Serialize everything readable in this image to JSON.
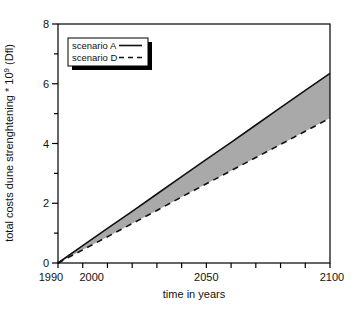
{
  "figure": {
    "background": "#ffffff",
    "axis_color": "#000000",
    "text_color": "#111111"
  },
  "chart_data": {
    "type": "line",
    "title": "",
    "xlabel": "time in years",
    "ylabel": "total costs dune strenghtening * 10⁹ (Dfl)",
    "ylabel_parts": {
      "text": "total costs dune strenghtening * 10",
      "sup": "9",
      "suffix": " (Dfl)"
    },
    "xlim": [
      1990,
      2100
    ],
    "ylim": [
      0,
      8
    ],
    "grid": false,
    "x": [
      1990,
      2000,
      2010,
      2020,
      2030,
      2040,
      2050,
      2060,
      2070,
      2080,
      2090,
      2100
    ],
    "series": [
      {
        "name": "scenario A",
        "line_style": "solid",
        "color": "#111111",
        "values": [
          0,
          0.58,
          1.16,
          1.73,
          2.31,
          2.89,
          3.47,
          4.04,
          4.62,
          5.2,
          5.78,
          6.35
        ]
      },
      {
        "name": "scenario D",
        "line_style": "dashed",
        "color": "#111111",
        "values": [
          0,
          0.44,
          0.88,
          1.32,
          1.76,
          2.21,
          2.65,
          3.09,
          3.53,
          3.97,
          4.41,
          4.85
        ]
      }
    ],
    "fill_between_series": true,
    "fill_color": "#a9a9a9",
    "xticks": {
      "step": 10,
      "labeled": [
        {
          "year": 1990,
          "label": "1990",
          "dx": -7
        },
        {
          "year": 2000,
          "label": "2000",
          "dx": 9
        },
        {
          "year": 2050,
          "label": "2050",
          "dx": 0
        },
        {
          "year": 2100,
          "label": "2100",
          "dx": 2
        }
      ]
    },
    "yticks": {
      "major": [
        0,
        2,
        4,
        6,
        8
      ],
      "minor": [
        1,
        3,
        5,
        7
      ]
    },
    "legend": {
      "position": "top-left",
      "entries": [
        "scenario A",
        "scenario D"
      ]
    }
  }
}
